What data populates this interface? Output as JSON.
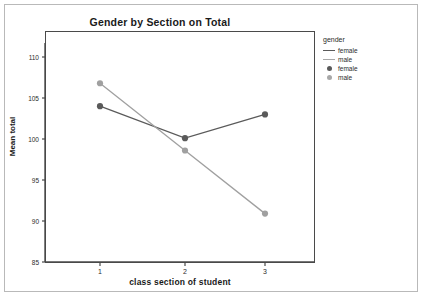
{
  "chart_data": {
    "type": "line",
    "title": "Gender by Section on Total",
    "xlabel": "class section of student",
    "ylabel": "Mean total",
    "categories": [
      "1",
      "2",
      "3"
    ],
    "xtick_labels": [
      "1",
      "2",
      "3"
    ],
    "ytick_labels": [
      "85",
      "90",
      "95",
      "100",
      "105",
      "110"
    ],
    "ylim": [
      85,
      110
    ],
    "grid": false,
    "legend_position": "right-outside",
    "legend_title": "gender",
    "series": [
      {
        "name": "female",
        "values": [
          104.0,
          100.1,
          103.0
        ],
        "color": "#5a5a5a"
      },
      {
        "name": "male",
        "values": [
          106.8,
          98.6,
          90.9
        ],
        "color": "#a0a0a0"
      }
    ],
    "legend_entries": [
      {
        "label": "female",
        "key": "line",
        "color": "#5a5a5a"
      },
      {
        "label": "male",
        "key": "line",
        "color": "#a8a8a8"
      },
      {
        "label": "female",
        "key": "marker",
        "color": "#5a5a5a"
      },
      {
        "label": "male",
        "key": "marker",
        "color": "#a8a8a8"
      }
    ]
  }
}
